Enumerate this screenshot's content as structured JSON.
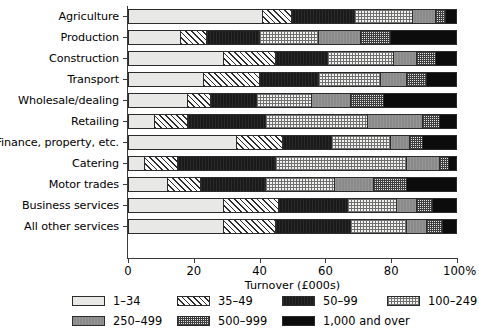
{
  "chart_data": {
    "type": "bar",
    "subtype": "horizontal-stacked-percentage",
    "title": "",
    "xlabel": "Turnover (£000s)",
    "ylabel": "",
    "xlim": [
      0,
      100
    ],
    "xticks": [
      0,
      20,
      40,
      60,
      80,
      100
    ],
    "xticklabels": [
      "0",
      "20",
      "40",
      "60",
      "80",
      "100%"
    ],
    "grid": false,
    "legend_position": "bottom",
    "categories": [
      "Agriculture",
      "Production",
      "Construction",
      "Transport",
      "Wholesale/dealing",
      "Retailing",
      "Finance, property, etc.",
      "Catering",
      "Motor trades",
      "Business services",
      "All other services"
    ],
    "series": [
      {
        "name": "1–34",
        "pattern": "p0",
        "values": [
          41,
          16,
          29,
          23,
          18,
          8,
          33,
          5,
          12,
          29,
          29
        ]
      },
      {
        "name": "35–49",
        "pattern": "p1",
        "values": [
          9,
          8,
          16,
          17,
          7,
          10,
          14,
          10,
          10,
          17,
          16
        ]
      },
      {
        "name": "50–99",
        "pattern": "p2",
        "values": [
          19,
          16,
          16,
          18,
          14,
          24,
          15,
          30,
          20,
          21,
          23
        ]
      },
      {
        "name": "100–249",
        "pattern": "p3",
        "values": [
          18,
          18,
          20,
          19,
          17,
          31,
          18,
          40,
          21,
          15,
          17
        ]
      },
      {
        "name": "250–499",
        "pattern": "p4",
        "values": [
          7,
          13,
          7,
          8,
          12,
          17,
          6,
          10,
          12,
          6,
          6
        ]
      },
      {
        "name": "500–999",
        "pattern": "p5",
        "values": [
          3,
          9,
          6,
          6,
          10,
          5,
          4,
          3,
          10,
          5,
          5
        ]
      },
      {
        "name": "1,000 and over",
        "pattern": "p6",
        "values": [
          3,
          20,
          6,
          9,
          22,
          5,
          10,
          2,
          15,
          7,
          4
        ]
      }
    ]
  },
  "legend": {
    "items": [
      {
        "label": "1–34",
        "pattern": "p0"
      },
      {
        "label": "35–49",
        "pattern": "p1"
      },
      {
        "label": "50–99",
        "pattern": "p2"
      },
      {
        "label": "100–249",
        "pattern": "p3"
      },
      {
        "label": "250–499",
        "pattern": "p4"
      },
      {
        "label": "500–999",
        "pattern": "p5"
      },
      {
        "label": "1,000 and over",
        "pattern": "p6"
      }
    ]
  }
}
